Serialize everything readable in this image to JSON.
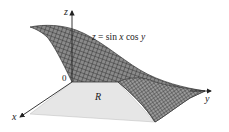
{
  "figure": {
    "equation": "z = sin x cos y",
    "equation_parts": {
      "lhs": "z",
      "eq": " = sin ",
      "x": "x",
      "mid": " cos ",
      "y": "y"
    },
    "region_label": "R",
    "origin_label": "0",
    "axes": {
      "x": "x",
      "y": "y",
      "z": "z"
    },
    "colors": {
      "surface": "#5a5a5a",
      "mesh": "#2a2a2a",
      "region": "#e6e6e6",
      "axis": "#222222"
    }
  }
}
